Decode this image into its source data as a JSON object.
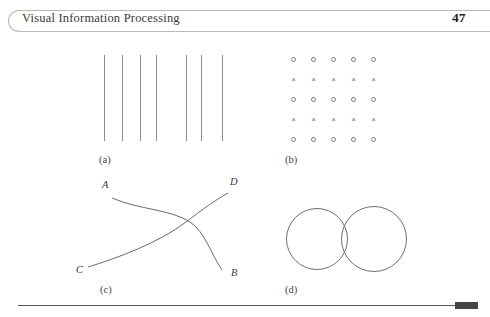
{
  "header": {
    "title": "Visual Information Processing",
    "page_number": "47"
  },
  "figure": {
    "panels": [
      {
        "id": "a",
        "label": "(a)",
        "kind": "vertical-lines",
        "description": "Seven vertical lines with uneven horizontal spacing",
        "line_count": 7,
        "line_x": [
          104,
          122,
          140,
          156,
          186,
          201,
          222
        ],
        "line_top": 55,
        "line_bottom": 141,
        "stroke_color": "#8c8c8c"
      },
      {
        "id": "b",
        "label": "(b)",
        "kind": "symbol-grid",
        "description": "Five by five grid of alternating rows of circles and crosses",
        "columns_x": [
          293,
          313,
          333,
          353,
          373
        ],
        "rows_y": [
          59,
          79,
          99,
          119,
          139
        ],
        "rows": [
          [
            "circle",
            "circle",
            "circle",
            "circle",
            "circle"
          ],
          [
            "cross",
            "cross",
            "cross",
            "cross",
            "cross"
          ],
          [
            "circle",
            "circle",
            "circle",
            "circle",
            "circle"
          ],
          [
            "cross",
            "cross",
            "cross",
            "cross",
            "cross"
          ],
          [
            "circle",
            "circle",
            "circle",
            "circle",
            "circle"
          ]
        ],
        "cross_glyph": "×",
        "stroke_color": "#7a7a7a"
      },
      {
        "id": "c",
        "label": "(c)",
        "kind": "crossing-curves",
        "description": "Two smooth curves crossing near the middle right",
        "curves": [
          {
            "name": "curve-A-B",
            "from_label": "A",
            "to_label": "B",
            "path": "M 112 162 C 140 174, 170 173, 190 186 C 205 196, 210 216, 222 234"
          },
          {
            "name": "curve-C-D",
            "from_label": "C",
            "to_label": "D",
            "path": "M 88 231 C 118 222, 160 206, 186 186 C 203 173, 214 165, 228 157"
          }
        ],
        "labels": [
          {
            "text": "A",
            "x": 102,
            "y": 150
          },
          {
            "text": "D",
            "x": 230,
            "y": 147
          },
          {
            "text": "C",
            "x": 76,
            "y": 227
          },
          {
            "text": "B",
            "x": 231,
            "y": 230
          }
        ],
        "stroke_color": "#6a6a6a"
      },
      {
        "id": "d",
        "label": "(d)",
        "kind": "overlapping-circles",
        "description": "Two overlapping outlined circles of equal size",
        "circles": [
          {
            "name": "left-circle",
            "cx": 317,
            "cy": 239,
            "r": 31
          },
          {
            "name": "right-circle",
            "cx": 374,
            "cy": 239,
            "r": 33
          }
        ],
        "stroke_color": "#6f6f6f"
      }
    ],
    "panel_label_positions": [
      {
        "id": "a",
        "x": 99,
        "y": 154
      },
      {
        "id": "b",
        "x": 285,
        "y": 154
      },
      {
        "id": "c",
        "x": 100,
        "y": 247
      },
      {
        "id": "d",
        "x": 285,
        "y": 247
      }
    ]
  },
  "footer": {
    "rule_color": "#565656",
    "block_color": "#454545"
  }
}
